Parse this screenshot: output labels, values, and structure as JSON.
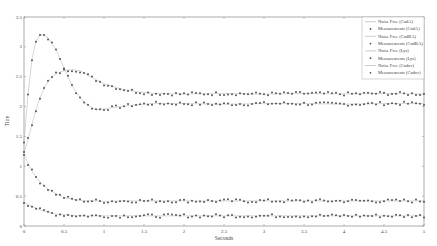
{
  "chart_data": {
    "type": "line",
    "title": "",
    "xlabel": "Seconds",
    "ylabel": "Titre",
    "xlim": [
      0,
      5
    ],
    "ylim": [
      0,
      3.5
    ],
    "xticks": [
      "0",
      "0.5",
      "1",
      "1.5",
      "2",
      "2.5",
      "3",
      "3.5",
      "4",
      "4.5",
      "5"
    ],
    "yticks": [
      "0",
      "0.5",
      "1",
      "1.5",
      "2",
      "2.5",
      "3",
      "3.5"
    ],
    "grid": false,
    "legend_position": "upper right",
    "legend": [
      "Noise Free (CadA)",
      "Measurements (CadA)",
      "Noise Free (CadBA)",
      "Measurements (CadBA)",
      "Noise Free (Lys)",
      "Measurements (Lys)",
      "Noise Free (Cadav)",
      "Measurements (Cadav)"
    ],
    "x": [
      0,
      0.05,
      0.1,
      0.15,
      0.2,
      0.25,
      0.3,
      0.4,
      0.5,
      0.6,
      0.7,
      0.8,
      0.9,
      1.0,
      1.2,
      1.4,
      1.6,
      2.0,
      2.5,
      3.0,
      3.5,
      4.0,
      4.5,
      5.0
    ],
    "series": [
      {
        "name": "CadA",
        "values": [
          1.4,
          2.2,
          2.8,
          3.1,
          3.2,
          3.2,
          3.15,
          2.95,
          2.65,
          2.35,
          2.15,
          2.02,
          1.95,
          1.96,
          2.0,
          2.03,
          2.05,
          2.05,
          2.04,
          2.05,
          2.05,
          2.04,
          2.05,
          2.05
        ]
      },
      {
        "name": "CadBA",
        "values": [
          1.22,
          1.45,
          1.7,
          1.95,
          2.15,
          2.3,
          2.42,
          2.55,
          2.6,
          2.62,
          2.6,
          2.52,
          2.45,
          2.38,
          2.3,
          2.25,
          2.22,
          2.21,
          2.22,
          2.21,
          2.22,
          2.21,
          2.22,
          2.21
        ]
      },
      {
        "name": "Lys",
        "values": [
          1.2,
          1.05,
          0.92,
          0.82,
          0.74,
          0.68,
          0.62,
          0.54,
          0.48,
          0.45,
          0.43,
          0.42,
          0.42,
          0.41,
          0.42,
          0.42,
          0.42,
          0.42,
          0.42,
          0.42,
          0.42,
          0.42,
          0.42,
          0.42
        ]
      },
      {
        "name": "Cadav",
        "values": [
          0.4,
          0.36,
          0.33,
          0.3,
          0.27,
          0.25,
          0.23,
          0.2,
          0.19,
          0.18,
          0.17,
          0.17,
          0.17,
          0.17,
          0.17,
          0.17,
          0.17,
          0.17,
          0.17,
          0.17,
          0.17,
          0.17,
          0.17,
          0.17
        ]
      }
    ]
  }
}
